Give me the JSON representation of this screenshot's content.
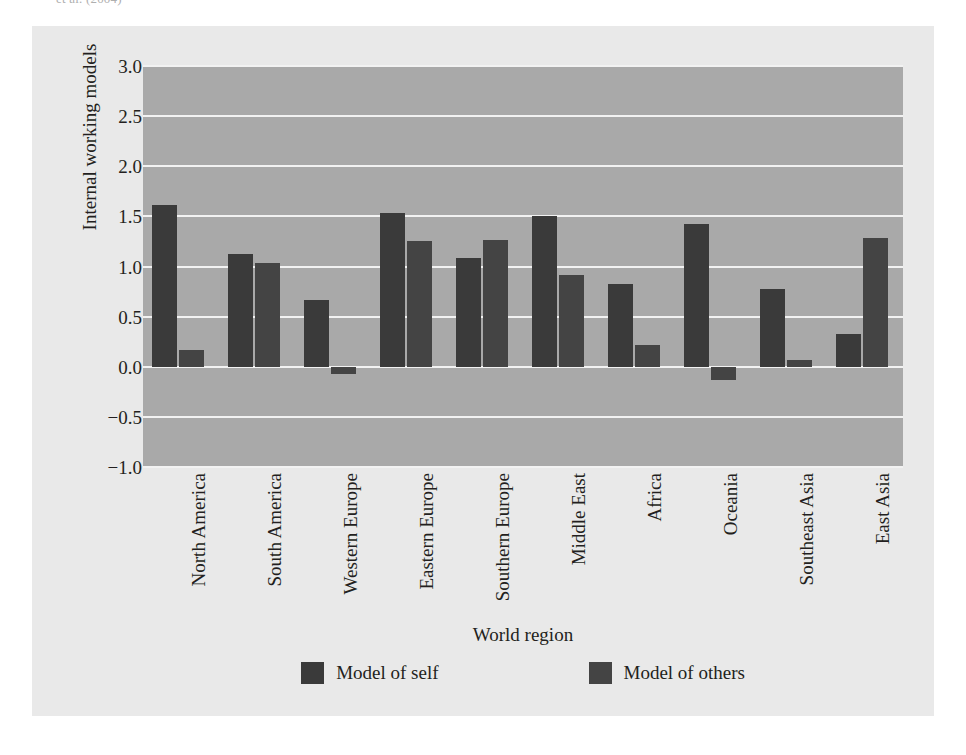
{
  "caption_fragment": "et al. (2004)",
  "figure": {
    "background_color": "#e9e9e9",
    "plot_background_color": "#a9a9a9",
    "gridline_color": "#f2f2f2"
  },
  "legend": {
    "items": [
      {
        "label": "Model of self",
        "color": "#3a3a3a",
        "swatch_name": "legend-swatch-model-of-self"
      },
      {
        "label": "Model of others",
        "color": "#444444",
        "swatch_name": "legend-swatch-model-of-others"
      }
    ]
  },
  "chart_data": {
    "type": "bar",
    "title": "",
    "subtitle": "",
    "xlabel": "World region",
    "ylabel": "Internal working models",
    "ylim": [
      -1.0,
      3.0
    ],
    "ytick_labels": [
      "3.0",
      "2.5",
      "2.0",
      "1.5",
      "1.0",
      "0.5",
      "0.0",
      "−0.5",
      "−1.0"
    ],
    "ytick_values": [
      3.0,
      2.5,
      2.0,
      1.5,
      1.0,
      0.5,
      0.0,
      -0.5,
      -1.0
    ],
    "grid": true,
    "grid_axis": "y",
    "legend_position": "bottom",
    "orientation": "vertical",
    "categories": [
      "North America",
      "South America",
      "Western Europe",
      "Eastern Europe",
      "Southern Europe",
      "Middle East",
      "Africa",
      "Oceania",
      "Southeast Asia",
      "East Asia"
    ],
    "series": [
      {
        "name": "Model of self",
        "color": "#3a3a3a",
        "values": [
          1.61,
          1.12,
          0.67,
          1.53,
          1.08,
          1.5,
          0.83,
          1.42,
          0.78,
          0.33
        ]
      },
      {
        "name": "Model of others",
        "color": "#444444",
        "values": [
          0.17,
          1.03,
          -0.07,
          1.25,
          1.26,
          0.92,
          0.22,
          -0.13,
          0.07,
          1.28
        ]
      }
    ]
  }
}
